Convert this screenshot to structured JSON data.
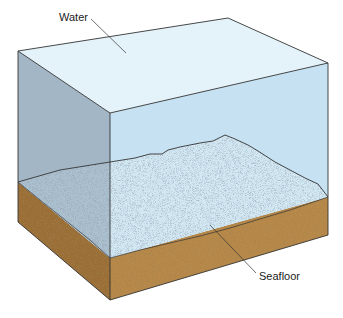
{
  "diagram": {
    "labels": {
      "water": "Water",
      "seafloor": "Seafloor"
    },
    "colors": {
      "water_top": "#e4f3fa",
      "water_front": "#c6e2f2",
      "water_left": "#a3b6c6",
      "seafloor_surface": "#d2e8f3",
      "sediment_front": "#b8894a",
      "sediment_left": "#9a6e36",
      "outline": "#333333"
    }
  }
}
